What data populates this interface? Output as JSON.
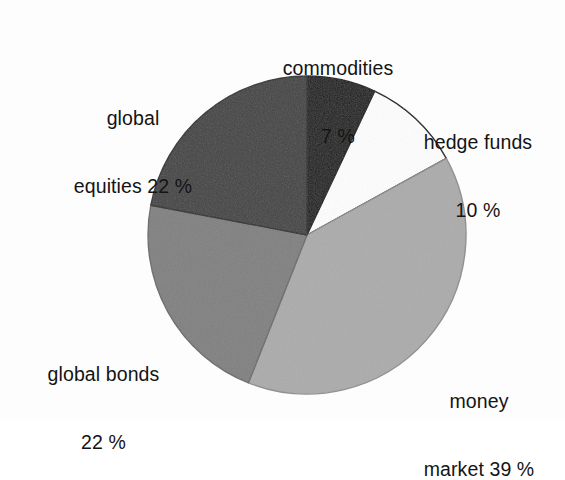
{
  "figure": {
    "background_color": "#fefefe",
    "text_color": "#141414"
  },
  "chart_data": {
    "type": "pie",
    "title": "",
    "subtitle": "",
    "xlabel": "",
    "ylabel": "",
    "legend_position": "none",
    "grid": false,
    "start_angle_deg": 0,
    "direction": "clockwise",
    "units": "percent",
    "total": 100,
    "categories": [
      "commodities",
      "hedge funds",
      "money market",
      "global bonds",
      "global equities"
    ],
    "values": [
      7,
      10,
      39,
      22,
      22
    ],
    "colors": [
      "#1b1b1b",
      "#fdfdfd",
      "#ababab",
      "#808080",
      "#434343"
    ],
    "slices": [
      {
        "name": "commodities",
        "value": 7,
        "value_text": "7%",
        "label_line1": "commodities",
        "label_line2": "7 %",
        "color": "#1b1b1b",
        "stroke": "#111111",
        "start_deg": 0,
        "end_deg": 25.2
      },
      {
        "name": "hedge funds",
        "value": 10,
        "value_text": "10%",
        "label_line1": "hedge funds",
        "label_line2": "10 %",
        "color": "#fdfdfd",
        "stroke": "#111111",
        "start_deg": 25.2,
        "end_deg": 61.2
      },
      {
        "name": "money market",
        "value": 39,
        "value_text": "39%",
        "label_line1": "money",
        "label_line2": "market 39 %",
        "color": "#ababab",
        "stroke": "#8e8e8e",
        "start_deg": 61.2,
        "end_deg": 201.6
      },
      {
        "name": "global bonds",
        "value": 22,
        "value_text": "22%",
        "label_line1": "global bonds",
        "label_line2": "22 %",
        "color": "#808080",
        "stroke": "#6b6b6b",
        "start_deg": 201.6,
        "end_deg": 280.8
      },
      {
        "name": "global equities",
        "value": 22,
        "value_text": "22%",
        "label_line1": "global",
        "label_line2": "equities 22 %",
        "color": "#434343",
        "stroke": "#2c2c2c",
        "start_deg": 280.8,
        "end_deg": 360
      }
    ]
  },
  "geometry": {
    "center_x": 307,
    "center_y": 235,
    "radius": 159
  }
}
